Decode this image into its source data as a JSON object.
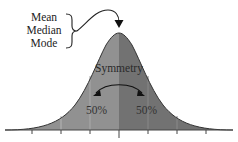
{
  "figure": {
    "labels": {
      "mean": "Mean",
      "median": "Median",
      "mode": "Mode",
      "symmetry": "Symmetry",
      "left_percent": "50%",
      "right_percent": "50%"
    },
    "colors": {
      "left_fill": "#8f8f8f",
      "right_fill": "#6f6f6f",
      "outline": "#333333",
      "axis": "#555555"
    },
    "axis_ticks": 7
  }
}
